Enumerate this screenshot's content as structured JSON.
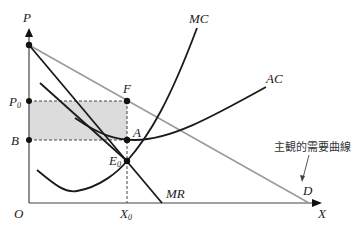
{
  "diagram": {
    "type": "economics-monopoly-cost-revenue",
    "axes": {
      "y_label": "P",
      "x_label": "X",
      "origin_label": "O"
    },
    "price_labels": {
      "p0_main": "P",
      "p0_sub": "0",
      "b": "B"
    },
    "quantity_labels": {
      "x0_main": "X",
      "x0_sub": "0"
    },
    "points": {
      "f": "F",
      "a": "A",
      "e0_main": "E",
      "e0_sub": "0",
      "d": "D"
    },
    "curves": {
      "mc": "MC",
      "ac": "AC",
      "mr": "MR"
    },
    "annotation": "主観的需要曲線",
    "colors": {
      "line": "#1a1a1a",
      "demand": "#9a9a9a",
      "shaded_area": "#dcdcdc",
      "dashed": "#444444"
    }
  }
}
